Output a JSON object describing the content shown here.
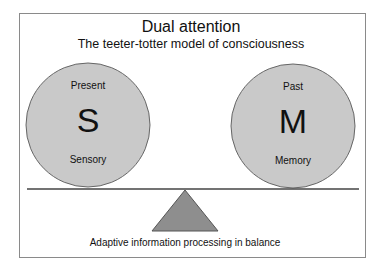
{
  "title": "Dual attention",
  "subtitle": "The teeter-totter model of consciousness",
  "left_circle": {
    "top_label": "Present",
    "letter": "S",
    "bottom_label": "Sensory"
  },
  "right_circle": {
    "top_label": "Past",
    "letter": "M",
    "bottom_label": "Memory"
  },
  "caption": "Adaptive information processing in balance",
  "colors": {
    "circle_fill": "#c9c9c9",
    "fulcrum_fill": "#8e8e8e",
    "outline": "#555555",
    "frame": "#8a8a8a"
  }
}
